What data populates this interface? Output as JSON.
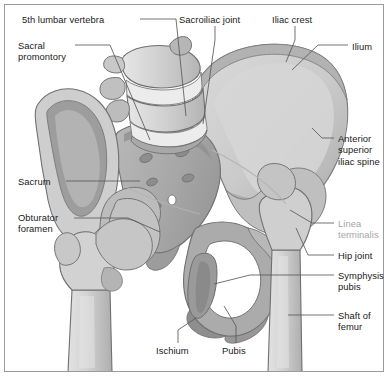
{
  "figure": {
    "frame_color": "#9b9b9b",
    "background_color": "#ffffff",
    "leader_line_color": "#5a5a5a",
    "label_color": "#1a1a1a",
    "muted_label_color": "#a6a6a6"
  },
  "labels": [
    {
      "id": "fifth-lumbar-vertebra",
      "text": "5th lumbar vertebra",
      "x": 22,
      "y": 14,
      "align": "left",
      "muted": false
    },
    {
      "id": "sacral-promontory",
      "text": "Sacral\npromontory",
      "x": 18,
      "y": 40,
      "align": "left",
      "muted": false
    },
    {
      "id": "sacroiliac-joint",
      "text": "Sacroiliac joint",
      "x": 179,
      "y": 14,
      "align": "left",
      "muted": false
    },
    {
      "id": "iliac-crest",
      "text": "Iliac crest",
      "x": 272,
      "y": 14,
      "align": "left",
      "muted": false
    },
    {
      "id": "ilium",
      "text": "Ilium",
      "x": 352,
      "y": 41,
      "align": "left",
      "muted": false
    },
    {
      "id": "anterior-superior-iliac-spine",
      "text": "Anterior\nsuperior\niliac spine",
      "x": 338,
      "y": 133,
      "align": "left",
      "muted": false
    },
    {
      "id": "linea-terminalis",
      "text": "Linea\nterminalis",
      "x": 338,
      "y": 218,
      "align": "left",
      "muted": true
    },
    {
      "id": "hip-joint",
      "text": "Hip joint",
      "x": 338,
      "y": 250,
      "align": "left",
      "muted": false
    },
    {
      "id": "symphysis-pubis",
      "text": "Symphysis\npubis",
      "x": 338,
      "y": 270,
      "align": "left",
      "muted": false
    },
    {
      "id": "shaft-of-femur",
      "text": "Shaft of\nfemur",
      "x": 338,
      "y": 310,
      "align": "left",
      "muted": false
    },
    {
      "id": "sacrum",
      "text": "Sacrum",
      "x": 18,
      "y": 176,
      "align": "left",
      "muted": false
    },
    {
      "id": "obturator-foramen",
      "text": "Obturator\nforamen",
      "x": 18,
      "y": 212,
      "align": "left",
      "muted": false
    },
    {
      "id": "ischium",
      "text": "Ischium",
      "x": 156,
      "y": 345,
      "align": "left",
      "muted": false
    },
    {
      "id": "pubis",
      "text": "Pubis",
      "x": 222,
      "y": 345,
      "align": "left",
      "muted": false
    }
  ],
  "anatomy_parts": [
    "5th lumbar vertebra",
    "Sacral promontory",
    "Sacroiliac joint",
    "Iliac crest",
    "Ilium",
    "Anterior superior iliac spine",
    "Linea terminalis",
    "Hip joint",
    "Symphysis pubis",
    "Shaft of femur",
    "Sacrum",
    "Obturator foramen",
    "Ischium",
    "Pubis"
  ],
  "palette": {
    "bone_light": "#dcdcdc",
    "bone_mid": "#c6c6c6",
    "bone_dark": "#aeaeae",
    "bone_darker": "#989898",
    "bone_shadow": "#868686",
    "bone_highlight": "#efefef",
    "outline": "#6e6e6e",
    "outline_soft": "#8c8c8c",
    "foramen_white": "#ffffff"
  }
}
